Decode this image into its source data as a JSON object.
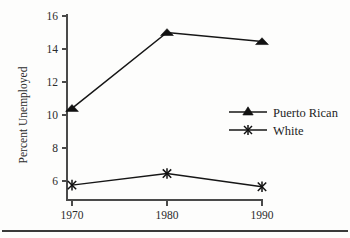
{
  "chart_data": {
    "type": "line",
    "title": "",
    "subtitle": "",
    "xlabel": "",
    "ylabel": "Percent Unemployed",
    "x": [
      1970,
      1980,
      1990
    ],
    "xtick_labels": [
      "1970",
      "1980",
      "1990"
    ],
    "ytick_labels": [
      "6",
      "8",
      "10",
      "12",
      "14",
      "16"
    ],
    "yticks": [
      6,
      8,
      10,
      12,
      14,
      16
    ],
    "xlim": [
      1970,
      1990
    ],
    "ylim": [
      5,
      16
    ],
    "grid": false,
    "legend_position": "center right",
    "series": [
      {
        "name": "Puerto Rican",
        "marker": "triangle-up-filled",
        "values": [
          10.4,
          15.0,
          14.45
        ]
      },
      {
        "name": "White",
        "marker": "x-cross",
        "values": [
          5.75,
          6.45,
          5.65
        ]
      }
    ],
    "colors": {
      "line": "#161616",
      "marker": "#111111",
      "axis": "#4a4a4a",
      "text": "#2b2b2b",
      "background": "#fdfdfc"
    }
  },
  "legend": {
    "entries": [
      {
        "label": "Puerto Rican"
      },
      {
        "label": "White"
      }
    ]
  },
  "axes": {
    "y_title": "Percent Unemployed",
    "y_ticks": [
      "16",
      "14",
      "12",
      "10",
      "8",
      "6"
    ],
    "x_ticks": [
      "1970",
      "1980",
      "1990"
    ]
  },
  "footer": {
    "rule_visible": true
  }
}
